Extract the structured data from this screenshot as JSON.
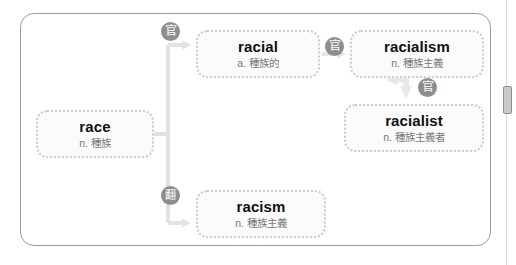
{
  "app": {
    "title": "Word family diagram"
  },
  "frame": {
    "label": "word-family-panel"
  },
  "scrollbar": {
    "label": "vertical-scrollbar"
  },
  "colors": {
    "frame_border": "#9a9a9a",
    "node_border": "#cccccc",
    "node_fill": "#fbfbfb",
    "word_text": "#111111",
    "gloss_text": "#777777",
    "badge_fill": "#8e8e8e",
    "wire": "#dcdcdc"
  },
  "nodes": {
    "race": {
      "word": "race",
      "pos": "n.",
      "meaning": "種族",
      "gloss": "n. 種族"
    },
    "racial": {
      "word": "racial",
      "pos": "a.",
      "meaning": "種族的",
      "gloss": "a. 種族的"
    },
    "racialism": {
      "word": "racialism",
      "pos": "n.",
      "meaning": "種族主義",
      "gloss": "n. 種族主義"
    },
    "racialist": {
      "word": "racialist",
      "pos": "n.",
      "meaning": "種族主義者",
      "gloss": "n. 種族主義者"
    },
    "racism": {
      "word": "racism",
      "pos": "n.",
      "meaning": "種族主義",
      "gloss": "n. 種族主義"
    }
  },
  "badges": {
    "racial": {
      "glyph": "官",
      "icon": "affix-badge-icon"
    },
    "racialism": {
      "glyph": "官",
      "icon": "affix-badge-icon"
    },
    "racialist": {
      "glyph": "官",
      "icon": "affix-badge-icon"
    },
    "racism": {
      "glyph": "翻",
      "icon": "affix-badge-dense-icon"
    }
  },
  "edges": [
    {
      "from": "race",
      "to": "racial"
    },
    {
      "from": "race",
      "to": "racism"
    },
    {
      "from": "racial",
      "to": "racialism"
    },
    {
      "from": "racialism",
      "to": "racialist"
    }
  ]
}
